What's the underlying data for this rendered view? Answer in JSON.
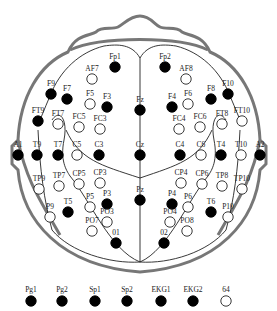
{
  "title": "",
  "colors": {
    "filled": "#000000",
    "hollow_fill": "#ffffff",
    "hollow_stroke": "#222222",
    "head_outline": "#777777",
    "lobe_lines": "#222222"
  },
  "electrodes": [
    {
      "label": "Fp1",
      "x": 115,
      "y": 67,
      "filled": true
    },
    {
      "label": "Fp2",
      "x": 165,
      "y": 67,
      "filled": true
    },
    {
      "label": "AF7",
      "x": 92,
      "y": 79,
      "filled": false
    },
    {
      "label": "AF8",
      "x": 186,
      "y": 79,
      "filled": false
    },
    {
      "label": "F9",
      "x": 51,
      "y": 94,
      "filled": true
    },
    {
      "label": "F7",
      "x": 67,
      "y": 99,
      "filled": true
    },
    {
      "label": "F5",
      "x": 90,
      "y": 104,
      "filled": false
    },
    {
      "label": "F3",
      "x": 107,
      "y": 107,
      "filled": true
    },
    {
      "label": "Fz",
      "x": 140,
      "y": 110,
      "filled": true
    },
    {
      "label": "F4",
      "x": 172,
      "y": 107,
      "filled": true
    },
    {
      "label": "F6",
      "x": 188,
      "y": 104,
      "filled": false
    },
    {
      "label": "F8",
      "x": 211,
      "y": 99,
      "filled": true
    },
    {
      "label": "F10",
      "x": 228,
      "y": 94,
      "filled": true
    },
    {
      "label": "FT9",
      "x": 38,
      "y": 121,
      "filled": true
    },
    {
      "label": "FT7",
      "x": 58,
      "y": 124,
      "filled": false
    },
    {
      "label": "FC5",
      "x": 79,
      "y": 127,
      "filled": false
    },
    {
      "label": "FC3",
      "x": 100,
      "y": 129,
      "filled": false
    },
    {
      "label": "FC4",
      "x": 179,
      "y": 129,
      "filled": false
    },
    {
      "label": "FC6",
      "x": 200,
      "y": 127,
      "filled": false
    },
    {
      "label": "FT8",
      "x": 222,
      "y": 124,
      "filled": false
    },
    {
      "label": "FT10",
      "x": 242,
      "y": 121,
      "filled": false
    },
    {
      "label": "A1",
      "x": 18,
      "y": 155,
      "filled": true
    },
    {
      "label": "T9",
      "x": 37,
      "y": 155,
      "filled": true
    },
    {
      "label": "T7",
      "x": 58,
      "y": 155,
      "filled": true
    },
    {
      "label": "C5",
      "x": 77,
      "y": 155,
      "filled": false
    },
    {
      "label": "C3",
      "x": 99,
      "y": 155,
      "filled": true
    },
    {
      "label": "Cz",
      "x": 140,
      "y": 155,
      "filled": true
    },
    {
      "label": "C4",
      "x": 180,
      "y": 155,
      "filled": true
    },
    {
      "label": "C6",
      "x": 201,
      "y": 155,
      "filled": false
    },
    {
      "label": "T4",
      "x": 221,
      "y": 155,
      "filled": true
    },
    {
      "label": "T10",
      "x": 241,
      "y": 155,
      "filled": false
    },
    {
      "label": "A2",
      "x": 260,
      "y": 155,
      "filled": true
    },
    {
      "label": "TP9",
      "x": 39,
      "y": 189,
      "filled": false
    },
    {
      "label": "TP7",
      "x": 59,
      "y": 186,
      "filled": false
    },
    {
      "label": "CP5",
      "x": 79,
      "y": 184,
      "filled": false
    },
    {
      "label": "CP3",
      "x": 100,
      "y": 183,
      "filled": false
    },
    {
      "label": "CP4",
      "x": 181,
      "y": 183,
      "filled": false
    },
    {
      "label": "CP6",
      "x": 202,
      "y": 184,
      "filled": false
    },
    {
      "label": "TP8",
      "x": 222,
      "y": 186,
      "filled": false
    },
    {
      "label": "TP10",
      "x": 242,
      "y": 189,
      "filled": false
    },
    {
      "label": "P9",
      "x": 50,
      "y": 217,
      "filled": false
    },
    {
      "label": "T5",
      "x": 68,
      "y": 212,
      "filled": true
    },
    {
      "label": "P5",
      "x": 90,
      "y": 207,
      "filled": false
    },
    {
      "label": "P3",
      "x": 107,
      "y": 204,
      "filled": true
    },
    {
      "label": "Pz",
      "x": 140,
      "y": 200,
      "filled": true
    },
    {
      "label": "P4",
      "x": 172,
      "y": 204,
      "filled": true
    },
    {
      "label": "P6",
      "x": 188,
      "y": 207,
      "filled": false
    },
    {
      "label": "T6",
      "x": 211,
      "y": 212,
      "filled": true
    },
    {
      "label": "P10",
      "x": 228,
      "y": 217,
      "filled": false
    },
    {
      "label": "PO3",
      "x": 107,
      "y": 222,
      "filled": false
    },
    {
      "label": "PO7",
      "x": 92,
      "y": 231,
      "filled": false
    },
    {
      "label": "PO4",
      "x": 170,
      "y": 222,
      "filled": false
    },
    {
      "label": "PO8",
      "x": 187,
      "y": 231,
      "filled": false
    },
    {
      "label": "01",
      "x": 116,
      "y": 243,
      "filled": true
    },
    {
      "label": "02",
      "x": 164,
      "y": 243,
      "filled": true
    }
  ],
  "legend": [
    {
      "label": "Pg1",
      "x": 31,
      "filled": true
    },
    {
      "label": "Pg2",
      "x": 62,
      "filled": true
    },
    {
      "label": "Sp1",
      "x": 95,
      "filled": true
    },
    {
      "label": "Sp2",
      "x": 127,
      "filled": true
    },
    {
      "label": "EKG1",
      "x": 161,
      "filled": true
    },
    {
      "label": "EKG2",
      "x": 193,
      "filled": true
    },
    {
      "label": "64",
      "x": 226,
      "filled": false
    }
  ]
}
